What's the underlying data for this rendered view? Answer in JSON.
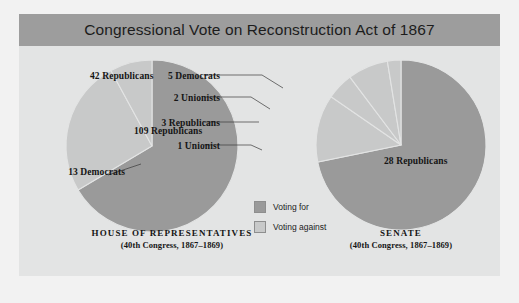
{
  "title": "Congressional Vote on Reconstruction Act of 1867",
  "colors": {
    "page_background": "#f2f2f2",
    "panel_background": "#e3e4e4",
    "title_bar": "#9d9d9d",
    "voting_for": "#9a9a9a",
    "voting_against": "#c8c9c9",
    "slice_divider": "#e3e4e4",
    "text": "#151515"
  },
  "legend": {
    "items": [
      {
        "label": "Voting for",
        "color": "#9a9a9a"
      },
      {
        "label": "Voting against",
        "color": "#c8c9c9"
      }
    ]
  },
  "charts": [
    {
      "id": "house",
      "caption_line1": "HOUSE OF REPRESENTATIVES",
      "caption_line2": "(40th Congress, 1867–1869)",
      "labels": {
        "for": "109 Republicans",
        "against_major": "42 Republicans",
        "against_minor": "13 Democrats"
      }
    },
    {
      "id": "senate",
      "caption_line1": "SENATE",
      "caption_line2": "(40th Congress, 1867–1869)",
      "labels": {
        "for": "28 Republicans",
        "democrats": "5 Democrats",
        "unionists2": "2 Unionists",
        "republicans3": "3 Republicans",
        "unionist1": "1 Unionist"
      }
    }
  ],
  "chart_data": [
    {
      "type": "pie",
      "title": "HOUSE OF REPRESENTATIVES",
      "subtitle": "(40th Congress, 1867–1869)",
      "total": 164,
      "legend": [
        "Voting for",
        "Voting against"
      ],
      "legend_position": "center",
      "slices": [
        {
          "label": "109 Republicans",
          "value": 109,
          "group": "Voting for",
          "party": "Republican",
          "color": "#9a9a9a"
        },
        {
          "label": "42 Republicans",
          "value": 42,
          "group": "Voting against",
          "party": "Republican",
          "color": "#c8c9c9"
        },
        {
          "label": "13 Democrats",
          "value": 13,
          "group": "Voting against",
          "party": "Democrat",
          "color": "#c8c9c9"
        }
      ]
    },
    {
      "type": "pie",
      "title": "SENATE",
      "subtitle": "(40th Congress, 1867–1869)",
      "total": 39,
      "legend": [
        "Voting for",
        "Voting against"
      ],
      "legend_position": "center",
      "slices": [
        {
          "label": "28 Republicans",
          "value": 28,
          "group": "Voting for",
          "party": "Republican",
          "color": "#9a9a9a"
        },
        {
          "label": "5 Democrats",
          "value": 5,
          "group": "Voting against",
          "party": "Democrat",
          "color": "#c8c9c9"
        },
        {
          "label": "2 Unionists",
          "value": 2,
          "group": "Voting against",
          "party": "Unionist",
          "color": "#c8c9c9"
        },
        {
          "label": "3 Republicans",
          "value": 3,
          "group": "Voting against",
          "party": "Republican",
          "color": "#c8c9c9"
        },
        {
          "label": "1 Unionist",
          "value": 1,
          "group": "Voting against",
          "party": "Unionist",
          "color": "#c8c9c9"
        }
      ]
    }
  ]
}
